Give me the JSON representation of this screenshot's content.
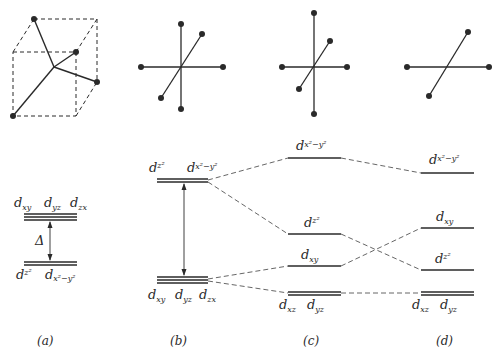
{
  "figure": {
    "type": "crystal field splitting diagram",
    "panels": [
      {
        "id": "a",
        "caption": "(a)",
        "geometry": "tetrahedral (ligands at alternate cube corners)",
        "upper_labels": [
          {
            "main": "d",
            "sub": "xy"
          },
          {
            "main": "d",
            "sub": "yz"
          },
          {
            "main": "d",
            "sub": "zx"
          }
        ],
        "gap_label": "Δ",
        "lower_labels": [
          {
            "main": "d",
            "sub": "z²"
          },
          {
            "main": "d",
            "sub": "x²−y²"
          }
        ]
      },
      {
        "id": "b",
        "caption": "(b)",
        "geometry": "octahedral",
        "upper_labels": [
          {
            "main": "d",
            "sub": "z²"
          },
          {
            "main": "d",
            "sub": "x²−y²"
          }
        ],
        "lower_labels": [
          {
            "main": "d",
            "sub": "xy"
          },
          {
            "main": "d",
            "sub": "yz"
          },
          {
            "main": "d",
            "sub": "zx"
          }
        ]
      },
      {
        "id": "c",
        "caption": "(c)",
        "geometry": "tetragonally elongated octahedron",
        "levels": [
          {
            "main": "d",
            "sub": "x²−y²"
          },
          {
            "main": "d",
            "sub": "z²"
          },
          {
            "main": "d",
            "sub": "xy"
          },
          {
            "main": "d",
            "sub": "xz",
            "main2": "d",
            "sub2": "yz"
          }
        ]
      },
      {
        "id": "d",
        "caption": "(d)",
        "geometry": "square planar",
        "levels": [
          {
            "main": "d",
            "sub": "x²−y²"
          },
          {
            "main": "d",
            "sub": "xy"
          },
          {
            "main": "d",
            "sub": "z²"
          },
          {
            "main": "d",
            "sub": "xz",
            "main2": "d",
            "sub2": "yz"
          }
        ]
      }
    ]
  },
  "colors": {
    "ink": "#2a2a2a",
    "background": "#ffffff"
  }
}
